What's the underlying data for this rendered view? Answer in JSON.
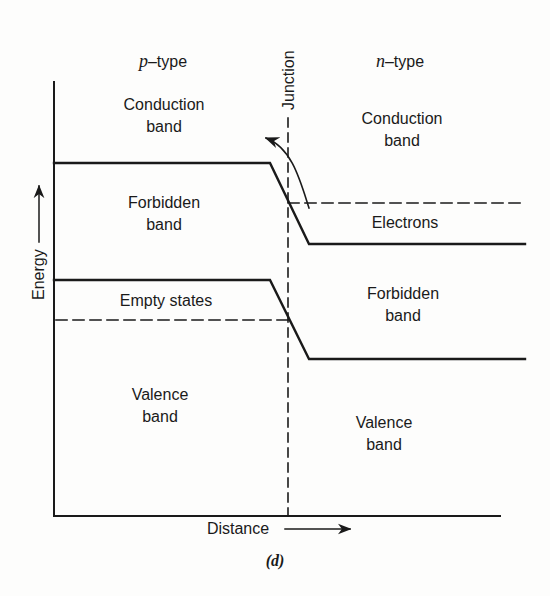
{
  "figure": {
    "caption": "(d)",
    "regions": {
      "p_side": {
        "title_var": "p",
        "title_suffix": "–type"
      },
      "n_side": {
        "title_var": "n",
        "title_suffix": "–type"
      }
    },
    "axes": {
      "y_label": "Energy",
      "x_label": "Distance"
    },
    "junction_label": "Junction",
    "labels": {
      "p_conduction_1": "Conduction",
      "p_conduction_2": "band",
      "p_forbidden_1": "Forbidden",
      "p_forbidden_2": "band",
      "p_empty_states": "Empty states",
      "p_valence_1": "Valence",
      "p_valence_2": "band",
      "n_conduction_1": "Conduction",
      "n_conduction_2": "band",
      "n_electrons": "Electrons",
      "n_forbidden_1": "Forbidden",
      "n_forbidden_2": "band",
      "n_valence_1": "Valence",
      "n_valence_2": "band"
    },
    "lines": {
      "conduction_band_edge": {
        "p_level_y": 163,
        "n_level_y": 244,
        "slope_start_x": 270,
        "slope_end_x": 309
      },
      "valence_band_edge": {
        "p_level_y": 280,
        "n_level_y": 359,
        "slope_start_x": 270,
        "slope_end_x": 309
      },
      "fermi_level_p_y": 320,
      "fermi_level_n_y": 203,
      "junction_x": 288
    },
    "colors": {
      "ink": "#1a1a1a",
      "paper": "#fdfdfc"
    }
  }
}
